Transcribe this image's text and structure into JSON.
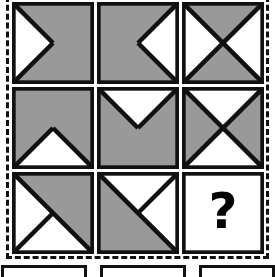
{
  "puzzle": {
    "type": "raven-progressive-matrix",
    "title_visible": false,
    "colors": {
      "fill_gray": "#999999",
      "stroke_black": "#111111",
      "background_white": "#ffffff"
    },
    "frame": {
      "style": "dashed",
      "color": "#111111"
    },
    "grid": {
      "rows": 3,
      "columns": 3,
      "cells": [
        {
          "index": 1,
          "position": "row1-col1",
          "name": "cell-r1c1",
          "description": "gray square with white triangle pointing right anchored on left edge",
          "base_fill": "#999999",
          "shapes": [
            {
              "kind": "polygon",
              "points": "0,0 50,50 0,100",
              "fill": "#ffffff"
            }
          ],
          "lines": [
            {
              "x1": 0,
              "y1": 0,
              "x2": 50,
              "y2": 50
            },
            {
              "x1": 0,
              "y1": 100,
              "x2": 50,
              "y2": 50
            }
          ],
          "label": ""
        },
        {
          "index": 2,
          "position": "row1-col2",
          "name": "cell-r1c2",
          "description": "gray square with white triangle pointing left anchored on right edge",
          "base_fill": "#999999",
          "shapes": [
            {
              "kind": "polygon",
              "points": "100,0 50,50 100,100",
              "fill": "#ffffff"
            }
          ],
          "lines": [
            {
              "x1": 100,
              "y1": 0,
              "x2": 50,
              "y2": 50
            },
            {
              "x1": 100,
              "y1": 100,
              "x2": 50,
              "y2": 50
            }
          ],
          "label": ""
        },
        {
          "index": 3,
          "position": "row1-col3",
          "name": "cell-r1c3",
          "description": "square split by both diagonals; top and bottom triangles gray, left and right triangles white",
          "base_fill": "#ffffff",
          "shapes": [
            {
              "kind": "polygon",
              "points": "0,0 100,0 50,50",
              "fill": "#999999"
            },
            {
              "kind": "polygon",
              "points": "0,100 100,100 50,50",
              "fill": "#999999"
            }
          ],
          "lines": [
            {
              "x1": 0,
              "y1": 0,
              "x2": 100,
              "y2": 100
            },
            {
              "x1": 100,
              "y1": 0,
              "x2": 0,
              "y2": 100
            }
          ],
          "label": ""
        },
        {
          "index": 4,
          "position": "row2-col1",
          "name": "cell-r2c1",
          "description": "gray square with white triangle pointing up anchored on bottom edge",
          "base_fill": "#999999",
          "shapes": [
            {
              "kind": "polygon",
              "points": "0,100 50,50 100,100",
              "fill": "#ffffff"
            }
          ],
          "lines": [
            {
              "x1": 0,
              "y1": 100,
              "x2": 50,
              "y2": 50
            },
            {
              "x1": 100,
              "y1": 100,
              "x2": 50,
              "y2": 50
            }
          ],
          "label": ""
        },
        {
          "index": 5,
          "position": "row2-col2",
          "name": "cell-r2c2",
          "description": "gray square with white triangle pointing down anchored on top edge",
          "base_fill": "#999999",
          "shapes": [
            {
              "kind": "polygon",
              "points": "0,0 100,0 50,50",
              "fill": "#ffffff"
            }
          ],
          "lines": [
            {
              "x1": 0,
              "y1": 0,
              "x2": 50,
              "y2": 50
            },
            {
              "x1": 100,
              "y1": 0,
              "x2": 50,
              "y2": 50
            }
          ],
          "label": ""
        },
        {
          "index": 6,
          "position": "row2-col3",
          "name": "cell-r2c3",
          "description": "square split by both diagonals; left and right triangles gray, top and bottom triangles white",
          "base_fill": "#ffffff",
          "shapes": [
            {
              "kind": "polygon",
              "points": "0,0 50,50 0,100",
              "fill": "#999999"
            },
            {
              "kind": "polygon",
              "points": "100,0 50,50 100,100",
              "fill": "#999999"
            }
          ],
          "lines": [
            {
              "x1": 0,
              "y1": 0,
              "x2": 100,
              "y2": 100
            },
            {
              "x1": 100,
              "y1": 0,
              "x2": 0,
              "y2": 100
            }
          ],
          "label": ""
        },
        {
          "index": 7,
          "position": "row3-col1",
          "name": "cell-r3c1",
          "description": "square split by main diagonal; upper-right gray, lower-left white, with extra line from bottom-left corner to center",
          "base_fill": "#ffffff",
          "shapes": [
            {
              "kind": "polygon",
              "points": "0,0 100,0 100,100",
              "fill": "#999999"
            }
          ],
          "lines": [
            {
              "x1": 0,
              "y1": 0,
              "x2": 100,
              "y2": 100
            },
            {
              "x1": 0,
              "y1": 100,
              "x2": 50,
              "y2": 50
            }
          ],
          "label": ""
        },
        {
          "index": 8,
          "position": "row3-col2",
          "name": "cell-r3c2",
          "description": "square split by main diagonal; lower-left gray, upper-right white, with extra line from top-right corner to center",
          "base_fill": "#ffffff",
          "shapes": [
            {
              "kind": "polygon",
              "points": "0,0 100,100 0,100",
              "fill": "#999999"
            }
          ],
          "lines": [
            {
              "x1": 0,
              "y1": 0,
              "x2": 100,
              "y2": 100
            },
            {
              "x1": 100,
              "y1": 0,
              "x2": 50,
              "y2": 50
            }
          ],
          "label": ""
        },
        {
          "index": 9,
          "position": "row3-col3",
          "name": "cell-missing-answer",
          "description": "empty white square containing a bold black question mark marking the missing tile",
          "base_fill": "#ffffff",
          "shapes": [],
          "lines": [],
          "label": "?"
        }
      ]
    },
    "answer_options": {
      "count": 3,
      "visible": "tops only, cropped at bottom of image",
      "items": [
        {
          "name": "answer-option-1",
          "label": ""
        },
        {
          "name": "answer-option-2",
          "label": ""
        },
        {
          "name": "answer-option-3",
          "label": ""
        }
      ]
    }
  }
}
